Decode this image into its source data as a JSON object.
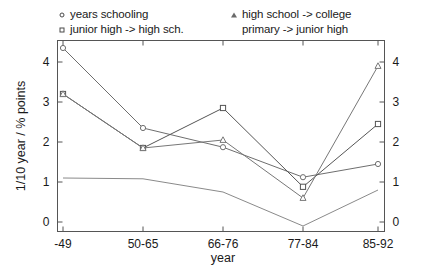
{
  "chart_data": {
    "type": "line",
    "title": "",
    "xlabel": "year",
    "ylabel": "1/10 year / % points",
    "categories": [
      "-49",
      "50-65",
      "66-76",
      "77-84",
      "85-92"
    ],
    "ylim": [
      -0.3,
      4.45
    ],
    "yticks": [
      0,
      1,
      2,
      3,
      4
    ],
    "yticklabels": [
      "0",
      "1",
      "2",
      "3",
      "4"
    ],
    "right_axis": true,
    "right_yticks": [
      0,
      1,
      2,
      3,
      4
    ],
    "right_yticklabels": [
      "0",
      "1",
      "2",
      "3",
      "4"
    ],
    "grid": false,
    "legend_position": "above-plot",
    "series": [
      {
        "name": "years schooling",
        "marker": "circle",
        "color": "#6e6e6e",
        "values": [
          4.35,
          2.35,
          1.87,
          1.12,
          1.45
        ]
      },
      {
        "name": "junior high -> high sch.",
        "marker": "square",
        "color": "#555555",
        "values": [
          3.2,
          1.85,
          2.85,
          0.88,
          2.45
        ]
      },
      {
        "name": "high school -> college",
        "marker": "triangle",
        "color": "#777777",
        "values": [
          3.2,
          1.85,
          2.05,
          0.6,
          3.9
        ]
      },
      {
        "name": "primary -> junior high",
        "marker": "none",
        "color": "#8a8a8a",
        "values": [
          1.1,
          1.08,
          0.75,
          -0.1,
          0.8
        ]
      }
    ]
  },
  "legend": {
    "entries": [
      {
        "marker": "circle",
        "label": "years schooling"
      },
      {
        "marker": "square",
        "label": "junior high -> high sch."
      },
      {
        "marker": "triangle",
        "label": "high school -> college"
      },
      {
        "marker": "none",
        "label": "primary -> junior high"
      }
    ]
  },
  "axes": {
    "y_label": "1/10 year / % points",
    "x_label": "year",
    "x_tick_0": "-49",
    "x_tick_1": "50-65",
    "x_tick_2": "66-76",
    "x_tick_3": "77-84",
    "x_tick_4": "85-92",
    "y_tick_0": "0",
    "y_tick_1": "1",
    "y_tick_2": "2",
    "y_tick_3": "3",
    "y_tick_4": "4",
    "ry_tick_0": "0",
    "ry_tick_1": "1",
    "ry_tick_2": "2",
    "ry_tick_3": "3",
    "ry_tick_4": "4"
  },
  "colors": {
    "axis": "#555555",
    "text": "#1a1a1a",
    "background": "#ffffff"
  }
}
